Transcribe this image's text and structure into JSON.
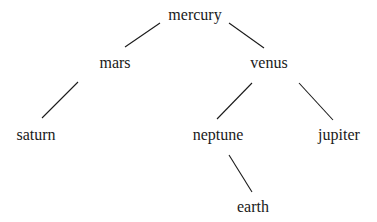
{
  "diagram": {
    "type": "tree",
    "nodes": [
      {
        "id": "mercury",
        "label": "mercury",
        "x": 195,
        "y": 20
      },
      {
        "id": "mars",
        "label": "mars",
        "x": 115,
        "y": 68
      },
      {
        "id": "venus",
        "label": "venus",
        "x": 269,
        "y": 68
      },
      {
        "id": "saturn",
        "label": "saturn",
        "x": 36,
        "y": 140
      },
      {
        "id": "neptune",
        "label": "neptune",
        "x": 218,
        "y": 140
      },
      {
        "id": "jupiter",
        "label": "jupiter",
        "x": 339,
        "y": 140
      },
      {
        "id": "earth",
        "label": "earth",
        "x": 253,
        "y": 212
      }
    ],
    "edges": [
      {
        "from": "mercury",
        "to": "mars",
        "x1": 160,
        "y1": 23,
        "x2": 125,
        "y2": 47
      },
      {
        "from": "mercury",
        "to": "venus",
        "x1": 229,
        "y1": 23,
        "x2": 264,
        "y2": 48
      },
      {
        "from": "mars",
        "to": "saturn",
        "x1": 78,
        "y1": 82,
        "x2": 42,
        "y2": 118
      },
      {
        "from": "venus",
        "to": "neptune",
        "x1": 252,
        "y1": 83,
        "x2": 217,
        "y2": 119
      },
      {
        "from": "venus",
        "to": "jupiter",
        "x1": 299,
        "y1": 83,
        "x2": 333,
        "y2": 120
      },
      {
        "from": "neptune",
        "to": "earth",
        "x1": 229,
        "y1": 155,
        "x2": 252,
        "y2": 192
      }
    ]
  }
}
